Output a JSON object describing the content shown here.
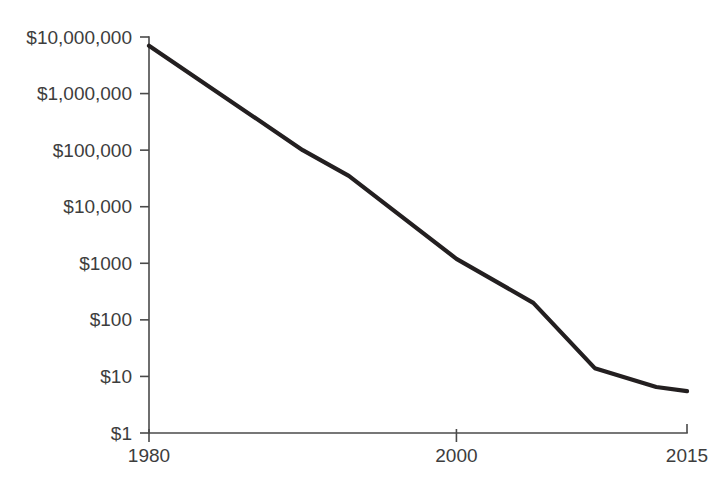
{
  "chart_data": {
    "type": "line",
    "title": "",
    "subtitle": "",
    "xlabel": "",
    "ylabel": "",
    "yscale": "log",
    "xscale": "linear",
    "grid": false,
    "legend": null,
    "legend_position": "none",
    "xlim": [
      1980,
      2015
    ],
    "ylim": [
      1,
      10000000
    ],
    "x_tick_values": [
      1980,
      2000,
      2015
    ],
    "x_tick_labels": [
      "1980",
      "2000",
      "2015"
    ],
    "y_tick_values": [
      10000000,
      1000000,
      100000,
      10000,
      1000,
      100,
      10,
      1
    ],
    "y_tick_labels": [
      "$10,000,000",
      "$1,000,000",
      "$100,000",
      "$10,000",
      "$1000",
      "$100",
      "$10",
      "$1"
    ],
    "series": [
      {
        "name": "cost",
        "x": [
          1980,
          1990,
          1993,
          2000,
          2005,
          2009,
          2013,
          2015
        ],
        "values": [
          7000000,
          100000,
          35000,
          1200,
          200,
          14,
          6.5,
          5.5
        ]
      }
    ],
    "colors": {
      "line": "#231f20",
      "axis": "#4a4a4a",
      "label": "#3d3d3d",
      "background": "#ffffff"
    },
    "annotations": []
  },
  "geometry": {
    "plot_left": 149,
    "plot_right": 687,
    "plot_top": 37,
    "plot_bottom": 433,
    "decade_px": 56.571,
    "tick_length": 9
  }
}
